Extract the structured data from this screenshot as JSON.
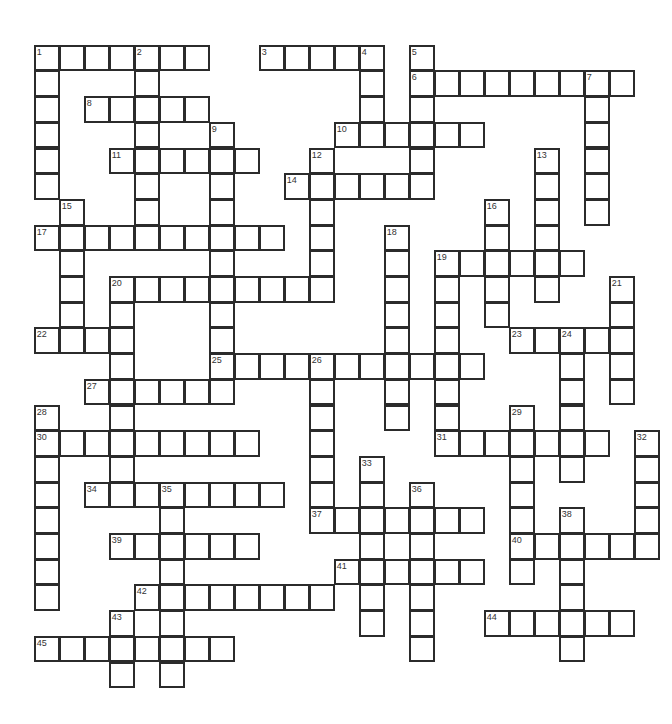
{
  "puzzle": {
    "type": "crossword",
    "layout": {
      "origin_x": 34.7,
      "origin_y": 45.7,
      "cell_w": 25.0,
      "cell_h": 25.7
    },
    "colors": {
      "border": "#2b2b2b",
      "cell_bg": "#ffffff",
      "number": "#333333"
    },
    "entries": [
      {
        "num": 1,
        "dir": "across",
        "row": 0,
        "col": 0,
        "len": 7
      },
      {
        "num": 1,
        "dir": "down",
        "row": 0,
        "col": 0,
        "len": 6
      },
      {
        "num": 2,
        "dir": "down",
        "row": 0,
        "col": 4,
        "len": 8
      },
      {
        "num": 3,
        "dir": "across",
        "row": 0,
        "col": 9,
        "len": 5
      },
      {
        "num": 4,
        "dir": "down",
        "row": 0,
        "col": 13,
        "len": 4
      },
      {
        "num": 5,
        "dir": "down",
        "row": 0,
        "col": 15,
        "len": 6
      },
      {
        "num": 6,
        "dir": "across",
        "row": 1,
        "col": 15,
        "len": 9
      },
      {
        "num": 7,
        "dir": "down",
        "row": 1,
        "col": 22,
        "len": 6
      },
      {
        "num": 8,
        "dir": "across",
        "row": 2,
        "col": 2,
        "len": 5
      },
      {
        "num": 9,
        "dir": "down",
        "row": 3,
        "col": 7,
        "len": 11
      },
      {
        "num": 10,
        "dir": "across",
        "row": 3,
        "col": 12,
        "len": 6
      },
      {
        "num": 11,
        "dir": "across",
        "row": 4,
        "col": 3,
        "len": 6
      },
      {
        "num": 12,
        "dir": "down",
        "row": 4,
        "col": 11,
        "len": 6
      },
      {
        "num": 13,
        "dir": "down",
        "row": 4,
        "col": 20,
        "len": 6
      },
      {
        "num": 14,
        "dir": "across",
        "row": 5,
        "col": 10,
        "len": 6
      },
      {
        "num": 15,
        "dir": "down",
        "row": 6,
        "col": 1,
        "len": 5
      },
      {
        "num": 16,
        "dir": "down",
        "row": 6,
        "col": 18,
        "len": 5
      },
      {
        "num": 17,
        "dir": "across",
        "row": 7,
        "col": 0,
        "len": 10
      },
      {
        "num": 18,
        "dir": "down",
        "row": 7,
        "col": 14,
        "len": 8
      },
      {
        "num": 19,
        "dir": "across",
        "row": 8,
        "col": 16,
        "len": 6
      },
      {
        "num": 19,
        "dir": "down",
        "row": 8,
        "col": 16,
        "len": 8
      },
      {
        "num": 20,
        "dir": "across",
        "row": 9,
        "col": 3,
        "len": 9
      },
      {
        "num": 20,
        "dir": "down",
        "row": 9,
        "col": 3,
        "len": 9
      },
      {
        "num": 21,
        "dir": "down",
        "row": 9,
        "col": 23,
        "len": 5
      },
      {
        "num": 22,
        "dir": "across",
        "row": 11,
        "col": 0,
        "len": 4
      },
      {
        "num": 23,
        "dir": "across",
        "row": 11,
        "col": 19,
        "len": 5
      },
      {
        "num": 24,
        "dir": "down",
        "row": 11,
        "col": 21,
        "len": 6
      },
      {
        "num": 25,
        "dir": "across",
        "row": 12,
        "col": 7,
        "len": 11
      },
      {
        "num": 26,
        "dir": "down",
        "row": 12,
        "col": 11,
        "len": 7
      },
      {
        "num": 27,
        "dir": "across",
        "row": 13,
        "col": 2,
        "len": 6
      },
      {
        "num": 28,
        "dir": "down",
        "row": 14,
        "col": 0,
        "len": 8
      },
      {
        "num": 29,
        "dir": "down",
        "row": 14,
        "col": 19,
        "len": 7
      },
      {
        "num": 30,
        "dir": "across",
        "row": 15,
        "col": 0,
        "len": 9
      },
      {
        "num": 31,
        "dir": "across",
        "row": 15,
        "col": 16,
        "len": 7
      },
      {
        "num": 32,
        "dir": "down",
        "row": 15,
        "col": 24,
        "len": 5
      },
      {
        "num": 33,
        "dir": "down",
        "row": 16,
        "col": 13,
        "len": 7
      },
      {
        "num": 34,
        "dir": "across",
        "row": 17,
        "col": 2,
        "len": 8
      },
      {
        "num": 35,
        "dir": "down",
        "row": 17,
        "col": 5,
        "len": 8
      },
      {
        "num": 36,
        "dir": "down",
        "row": 17,
        "col": 15,
        "len": 7
      },
      {
        "num": 37,
        "dir": "across",
        "row": 18,
        "col": 11,
        "len": 7
      },
      {
        "num": 38,
        "dir": "down",
        "row": 18,
        "col": 21,
        "len": 6
      },
      {
        "num": 39,
        "dir": "across",
        "row": 19,
        "col": 3,
        "len": 6
      },
      {
        "num": 40,
        "dir": "across",
        "row": 19,
        "col": 19,
        "len": 6
      },
      {
        "num": 41,
        "dir": "across",
        "row": 20,
        "col": 12,
        "len": 6
      },
      {
        "num": 42,
        "dir": "across",
        "row": 21,
        "col": 4,
        "len": 8
      },
      {
        "num": 43,
        "dir": "down",
        "row": 22,
        "col": 3,
        "len": 3
      },
      {
        "num": 44,
        "dir": "across",
        "row": 22,
        "col": 18,
        "len": 6
      },
      {
        "num": 45,
        "dir": "across",
        "row": 23,
        "col": 0,
        "len": 8
      }
    ]
  }
}
